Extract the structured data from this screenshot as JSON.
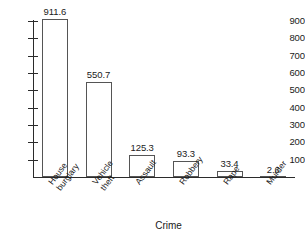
{
  "chart_data": {
    "type": "bar",
    "title": "",
    "xlabel": "Crime",
    "ylabel": "",
    "categories": [
      "House burglary",
      "Vehicle theft",
      "Assault",
      "Robbery",
      "Rape",
      "Murder"
    ],
    "category_lines": [
      [
        "House",
        "burglary"
      ],
      [
        "Vehicle",
        "theft"
      ],
      [
        "Assault"
      ],
      [
        "Robbery"
      ],
      [
        "Rape"
      ],
      [
        "Murder"
      ]
    ],
    "values": [
      911.6,
      550.7,
      125.3,
      93.3,
      33.4,
      2.6
    ],
    "value_labels": [
      "911.6",
      "550.7",
      "125.3",
      "93.3",
      "33.4",
      "2.6"
    ],
    "ylim": [
      0,
      900
    ],
    "yticks": [
      900,
      800,
      700,
      600,
      500,
      400,
      300,
      200,
      100
    ],
    "ytick_labels": [
      "900",
      "800",
      "700",
      "600",
      "500",
      "400",
      "300",
      "200",
      "100"
    ],
    "grid": false,
    "legend": false,
    "bar_fill_color": "#ffffff",
    "bar_edge_color": "#555555",
    "axis_color": "#2b2b2b",
    "text_color": "#1a1a1a"
  }
}
